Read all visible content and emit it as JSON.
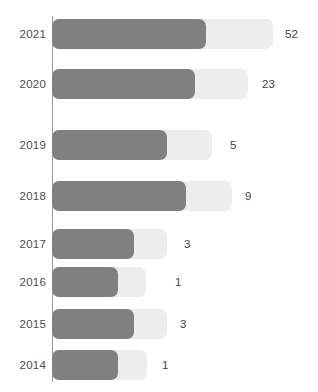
{
  "chart_data": {
    "type": "bar",
    "orientation": "horizontal",
    "title": "",
    "subtitle": "",
    "xlabel": "",
    "ylabel": "",
    "grid": false,
    "legend": "none",
    "axis_line": true,
    "categories": [
      "2021",
      "2020",
      "2019",
      "2018",
      "2017",
      "2016",
      "2015",
      "2014"
    ],
    "values": [
      52,
      23,
      5,
      9,
      3,
      1,
      3,
      1
    ],
    "series": [
      {
        "name": "value",
        "values": [
          52,
          23,
          5,
          9,
          3,
          1,
          3,
          1
        ]
      }
    ],
    "bars": [
      {
        "category": "2021",
        "value": 52,
        "value_label": "52",
        "fill_width_px": 154,
        "track_width_px": 221,
        "label_x_px": 285
      },
      {
        "category": "2020",
        "value": 23,
        "value_label": "23",
        "fill_width_px": 143,
        "track_width_px": 196,
        "label_x_px": 262
      },
      {
        "category": "2019",
        "value": 5,
        "value_label": "5",
        "fill_width_px": 115,
        "track_width_px": 160,
        "label_x_px": 230
      },
      {
        "category": "2018",
        "value": 9,
        "value_label": "9",
        "fill_width_px": 134,
        "track_width_px": 180,
        "label_x_px": 245
      },
      {
        "category": "2017",
        "value": 3,
        "value_label": "3",
        "fill_width_px": 82,
        "track_width_px": 115,
        "label_x_px": 184
      },
      {
        "category": "2016",
        "value": 1,
        "value_label": "1",
        "fill_width_px": 66,
        "track_width_px": 94,
        "label_x_px": 175
      },
      {
        "category": "2015",
        "value": 3,
        "value_label": "3",
        "fill_width_px": 82,
        "track_width_px": 115,
        "label_x_px": 180
      },
      {
        "category": "2014",
        "value": 1,
        "value_label": "1",
        "fill_width_px": 66,
        "track_width_px": 95,
        "label_x_px": 162
      }
    ],
    "row_tops_px": [
      17,
      67,
      128,
      179,
      227,
      265,
      307,
      348
    ],
    "colors": {
      "bar_fill": "#808080",
      "bar_track": "#ededed",
      "category_text": "#4c4c4c",
      "value_text": "#3f3f3f",
      "axis_line": "#9a9a9a",
      "background": "#ffffff"
    }
  }
}
